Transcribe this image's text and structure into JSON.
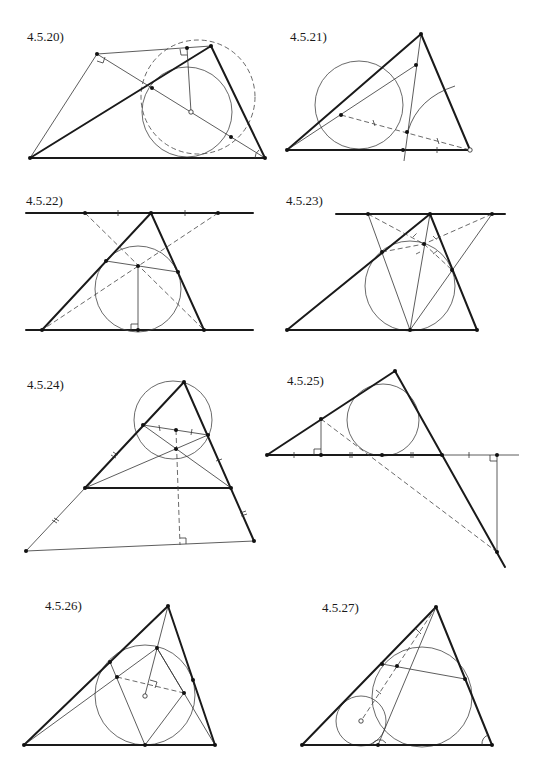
{
  "page": {
    "figures": [
      {
        "id": "fig-4-5-20",
        "label": "4.5.20)"
      },
      {
        "id": "fig-4-5-21",
        "label": "4.5.21)"
      },
      {
        "id": "fig-4-5-22",
        "label": "4.5.22)"
      },
      {
        "id": "fig-4-5-23",
        "label": "4.5.23)"
      },
      {
        "id": "fig-4-5-24",
        "label": "4.5.24)"
      },
      {
        "id": "fig-4-5-25",
        "label": "4.5.25)"
      },
      {
        "id": "fig-4-5-26",
        "label": "4.5.26)"
      },
      {
        "id": "fig-4-5-27",
        "label": "4.5.27)"
      }
    ]
  },
  "colors": {
    "ink": "#1a1a1a",
    "background": "#ffffff"
  }
}
